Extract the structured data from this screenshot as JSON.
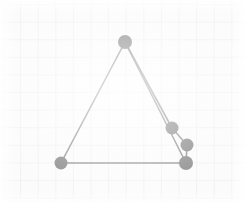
{
  "figure": {
    "background_color": "#fbfbfb",
    "grid": {
      "visible": true,
      "line_color": "#dfe3e8",
      "minor_line_color": "#eceef1",
      "spacing_px": 17.6,
      "origin_x_px": 2.5,
      "origin_y_px": 4.0,
      "extent_left_px": 14,
      "extent_top_px": 9,
      "extent_right_px": 228,
      "extent_bottom_px": 196
    },
    "stroke": {
      "color": "#3a3a3c",
      "width_px": 1.6
    },
    "marker": {
      "color": "#2b2b2d",
      "shape": "filled-circle",
      "radius_px": 6.5
    }
  },
  "chart_data": {
    "type": "scatter",
    "xlabel": "",
    "ylabel": "",
    "grid": true,
    "legend": null,
    "xlim": [
      0,
      246
    ],
    "ylim": [
      203,
      0
    ],
    "points": [
      {
        "name": "apex",
        "x": 125,
        "y": 42
      },
      {
        "name": "bottom-left",
        "x": 61,
        "y": 163
      },
      {
        "name": "right-upper",
        "x": 172,
        "y": 128
      },
      {
        "name": "right-middle",
        "x": 187,
        "y": 145
      },
      {
        "name": "bottom-right",
        "x": 186,
        "y": 163
      }
    ],
    "segments": [
      {
        "name": "left-edge",
        "from": "apex",
        "to": "bottom-left",
        "x1": 125,
        "y1": 42,
        "x2": 61,
        "y2": 163
      },
      {
        "name": "base-edge",
        "from": "bottom-left",
        "to": "bottom-right",
        "x1": 61,
        "y1": 163,
        "x2": 186,
        "y2": 163
      },
      {
        "name": "right-edge-outer",
        "from": "apex",
        "to": "bottom-right",
        "x1": 125,
        "y1": 42,
        "x2": 186,
        "y2": 163
      },
      {
        "name": "right-edge-inner",
        "from": "apex",
        "to": "right-upper",
        "x1": 125,
        "y1": 42,
        "x2": 172,
        "y2": 128
      },
      {
        "name": "right-chain-upper",
        "from": "right-upper",
        "to": "right-middle",
        "x1": 172,
        "y1": 128,
        "x2": 187,
        "y2": 145
      },
      {
        "name": "right-chain-lower",
        "from": "right-middle",
        "to": "bottom-right",
        "x1": 187,
        "y1": 145,
        "x2": 186,
        "y2": 163
      }
    ]
  }
}
